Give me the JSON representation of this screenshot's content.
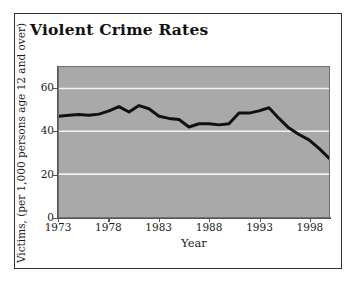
{
  "figure": {
    "title": "Violent Crime Rates",
    "frame_color": "#333333",
    "background_color": "#ffffff"
  },
  "chart_data": {
    "type": "line",
    "title": "Violent Crime Rates",
    "xlabel": "Year",
    "ylabel": "Victims, (per 1,000 persons age 12 and over)",
    "xlim": [
      1973,
      2000
    ],
    "ylim": [
      0,
      70
    ],
    "xticks": [
      1973,
      1978,
      1983,
      1988,
      1993,
      1998
    ],
    "xtick_labels": [
      "1973",
      "1978",
      "1983",
      "1988",
      "1993",
      "1998"
    ],
    "yticks": [
      0,
      20,
      40,
      60
    ],
    "ytick_labels": [
      "0",
      "20",
      "40",
      "60"
    ],
    "grid": "horizontal",
    "gridline_color": "#f2f2f2",
    "gridline_values": [
      20,
      40,
      60
    ],
    "plot_background_color": "#a9a9a9",
    "line_color": "#111111",
    "line_width": 3,
    "legend": null,
    "x": [
      1973,
      1974,
      1975,
      1976,
      1977,
      1978,
      1979,
      1980,
      1981,
      1982,
      1983,
      1984,
      1985,
      1986,
      1987,
      1988,
      1989,
      1990,
      1991,
      1992,
      1993,
      1994,
      1995,
      1996,
      1997,
      1998,
      1999,
      2000
    ],
    "values": [
      47.0,
      47.5,
      47.8,
      47.5,
      48.0,
      49.5,
      51.5,
      49.0,
      52.0,
      50.5,
      47.0,
      46.0,
      45.5,
      42.0,
      43.5,
      43.5,
      43.0,
      43.5,
      48.5,
      48.5,
      49.5,
      51.0,
      46.0,
      41.5,
      38.5,
      36.0,
      32.0,
      27.5
    ],
    "series": [
      {
        "name": "Violent crime victimization rate",
        "values": [
          47.0,
          47.5,
          47.8,
          47.5,
          48.0,
          49.5,
          51.5,
          49.0,
          52.0,
          50.5,
          47.0,
          46.0,
          45.5,
          42.0,
          43.5,
          43.5,
          43.0,
          43.5,
          48.5,
          48.5,
          49.5,
          51.0,
          46.0,
          41.5,
          38.5,
          36.0,
          32.0,
          27.5
        ]
      }
    ]
  }
}
